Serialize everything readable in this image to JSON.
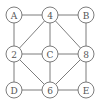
{
  "diagram": {
    "type": "graph",
    "nodes": [
      {
        "id": "A",
        "label": "A",
        "x": 14,
        "y": 15
      },
      {
        "id": "4",
        "label": "4",
        "x": 50,
        "y": 15
      },
      {
        "id": "B",
        "label": "B",
        "x": 86,
        "y": 15
      },
      {
        "id": "2",
        "label": "2",
        "x": 14,
        "y": 54
      },
      {
        "id": "C",
        "label": "C",
        "x": 50,
        "y": 54
      },
      {
        "id": "8",
        "label": "8",
        "x": 86,
        "y": 54
      },
      {
        "id": "D",
        "label": "D",
        "x": 14,
        "y": 90
      },
      {
        "id": "6",
        "label": "6",
        "x": 50,
        "y": 90
      },
      {
        "id": "E",
        "label": "E",
        "x": 86,
        "y": 90
      }
    ],
    "edges": [
      [
        "A",
        "4"
      ],
      [
        "4",
        "B"
      ],
      [
        "A",
        "2"
      ],
      [
        "B",
        "8"
      ],
      [
        "4",
        "2"
      ],
      [
        "4",
        "C"
      ],
      [
        "4",
        "8"
      ],
      [
        "2",
        "C"
      ],
      [
        "C",
        "8"
      ],
      [
        "2",
        "D"
      ],
      [
        "2",
        "6"
      ],
      [
        "C",
        "6"
      ],
      [
        "8",
        "6"
      ],
      [
        "8",
        "E"
      ],
      [
        "D",
        "6"
      ],
      [
        "6",
        "E"
      ]
    ],
    "node_radius": 8,
    "colors": {
      "stroke": "#6e6e6e",
      "text": "#555555",
      "background": "#ffffff"
    }
  }
}
